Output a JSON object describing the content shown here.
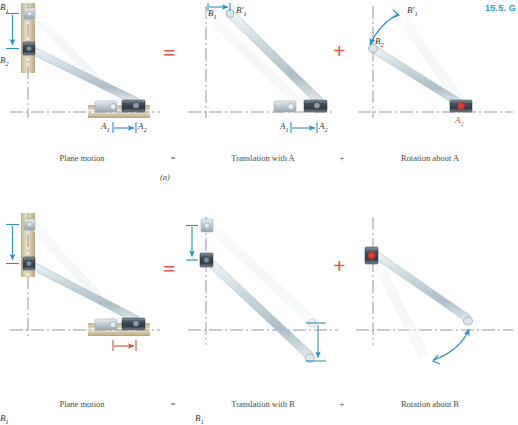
{
  "header": {
    "running_head": "15.5. G"
  },
  "colors": {
    "accent_blue": "#2e8fc0",
    "operator_red": "#e8584c",
    "label_red": "#d2504a",
    "rod_fill": "#cdd9de",
    "rod_light": "#e3edf1",
    "track_tan": "#cdbf9a",
    "slider_dark": "#4a5560",
    "axis_gray": "#6d6d6d"
  },
  "rows": [
    {
      "id": "row-a",
      "sub_label": "(a)",
      "operators": {
        "equals": "=",
        "plus": "+"
      },
      "panels": [
        {
          "id": "plane-motion-a",
          "caption": "Plane motion",
          "labels": {
            "b1": "B",
            "b1_sub": "1",
            "b2": "B",
            "b2_sub": "2",
            "a1": "A",
            "a1_sub": "1",
            "a2": "A",
            "a2_sub": "2"
          },
          "arrow_b_color": "#2e8fc0",
          "arrow_a_color": "#2e8fc0"
        },
        {
          "id": "translation-with-a",
          "caption": "Translation with A",
          "labels": {
            "b1": "B",
            "b1_sub": "1",
            "b1p": "B′",
            "b1p_sub": "1",
            "a1": "A",
            "a1_sub": "1",
            "a2": "A",
            "a2_sub": "2"
          },
          "arrow_b_color": "#2e8fc0",
          "arrow_a_color": "#2e8fc0"
        },
        {
          "id": "rotation-about-a",
          "caption": "Rotation about A",
          "labels": {
            "b1p": "B′",
            "b1p_sub": "1",
            "b2": "B",
            "b2_sub": "2",
            "a2": "A",
            "a2_sub": "2"
          },
          "arc_color": "#2e8fc0",
          "pivot_color": "#e03a30"
        }
      ]
    },
    {
      "id": "row-b",
      "sub_label": "",
      "operators": {
        "equals": "=",
        "plus": "+"
      },
      "panels": [
        {
          "id": "plane-motion-b",
          "caption": "Plane motion",
          "labels": {
            "b1": "B",
            "b1_sub": "1",
            "b2": "B",
            "b2_sub": "2",
            "a1": "A",
            "a1_sub": "1",
            "a2": "A",
            "a2_sub": "2"
          },
          "arrow_b_color": "#2e8fc0",
          "arrow_a_color": "#d2504a"
        },
        {
          "id": "translation-with-b",
          "caption": "Translation with B",
          "labels": {
            "b1": "B",
            "b1_sub": "1",
            "b2": "B",
            "b2_sub": "2",
            "a1": "A",
            "a1_sub": "1",
            "a1p": "A′",
            "a1p_sub": "1"
          },
          "arrow_b_color": "#2e8fc0",
          "arrow_a_color": "#2e8fc0"
        },
        {
          "id": "rotation-about-b",
          "caption": "Rotation about B",
          "labels": {
            "b2": "B",
            "b2_sub": "2",
            "a2": "A",
            "a2_sub": "2",
            "a1p": "A′",
            "a1p_sub": "1"
          },
          "arc_color": "#2e8fc0",
          "pivot_color": "#e03a30"
        }
      ]
    }
  ]
}
